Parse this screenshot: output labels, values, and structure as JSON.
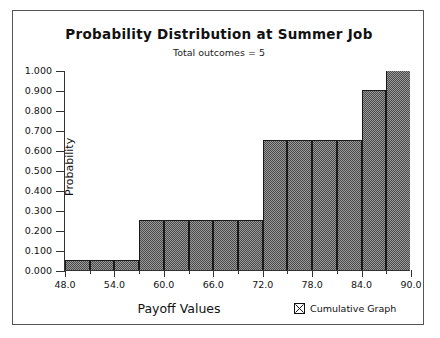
{
  "chart_data": {
    "type": "bar",
    "title": "Probability Distribution at Summer Job",
    "subtitle": "Total outcomes = 5",
    "xlabel": "Payoff Values",
    "ylabel": "Probability",
    "xlim": [
      48.0,
      90.0
    ],
    "ylim": [
      0.0,
      1.0
    ],
    "grid": false,
    "bin_width": 3.0,
    "categories": [
      "48.0-51.0",
      "51.0-54.0",
      "54.0-57.0",
      "57.0-60.0",
      "60.0-63.0",
      "63.0-66.0",
      "66.0-69.0",
      "69.0-72.0",
      "72.0-75.0",
      "75.0-78.0",
      "78.0-81.0",
      "81.0-84.0",
      "84.0-87.0",
      "87.0-90.0"
    ],
    "values": [
      0.05,
      0.05,
      0.05,
      0.25,
      0.25,
      0.25,
      0.25,
      0.25,
      0.65,
      0.65,
      0.65,
      0.65,
      0.9,
      1.0
    ],
    "bin_starts": [
      48.0,
      51.0,
      54.0,
      57.0,
      60.0,
      63.0,
      66.0,
      69.0,
      72.0,
      75.0,
      78.0,
      81.0,
      84.0,
      87.0
    ],
    "x_ticks_major": [
      48.0,
      54.0,
      60.0,
      66.0,
      72.0,
      78.0,
      84.0,
      90.0
    ],
    "x_tick_labels": [
      "48.0",
      "54.0",
      "60.0",
      "66.0",
      "72.0",
      "78.0",
      "84.0",
      "90.0"
    ],
    "x_ticks_minor": [
      51.0,
      57.0,
      63.0,
      69.0,
      75.0,
      81.0,
      87.0
    ],
    "y_ticks": [
      0.0,
      0.1,
      0.2,
      0.3,
      0.4,
      0.5,
      0.6,
      0.7,
      0.8,
      0.9,
      1.0
    ],
    "y_tick_labels": [
      "0.000",
      "0.100",
      "0.200",
      "0.300",
      "0.400",
      "0.500",
      "0.600",
      "0.700",
      "0.800",
      "0.900",
      "1.000"
    ],
    "legend_position": "bottom-right",
    "legend": [
      {
        "label": "Cumulative Graph",
        "checked": true
      }
    ],
    "colors": {
      "bar_fill": "#9a9a9a",
      "bar_hatch": "#4a4a4a",
      "bar_outline": "#1a1a1a",
      "axis": "#333333",
      "text": "#111111",
      "background": "#ffffff",
      "frame": "#555555"
    }
  },
  "legend": {
    "cumulative_label": "Cumulative Graph"
  }
}
